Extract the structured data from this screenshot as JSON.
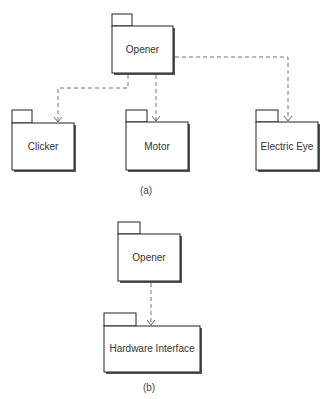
{
  "diagram_a": {
    "caption": "(a)",
    "packages": {
      "opener": {
        "label": "Opener"
      },
      "clicker": {
        "label": "Clicker"
      },
      "motor": {
        "label": "Motor"
      },
      "electric_eye": {
        "label": "Electric Eye"
      }
    },
    "dependencies": [
      {
        "from": "Opener",
        "to": "Clicker",
        "style": "dashed",
        "arrow": "open"
      },
      {
        "from": "Opener",
        "to": "Motor",
        "style": "dashed",
        "arrow": "open"
      },
      {
        "from": "Opener",
        "to": "Electric Eye",
        "style": "dashed",
        "arrow": "open"
      }
    ]
  },
  "diagram_b": {
    "caption": "(b)",
    "packages": {
      "opener": {
        "label": "Opener"
      },
      "hardware_interface": {
        "label": "Hardware Interface"
      }
    },
    "dependencies": [
      {
        "from": "Opener",
        "to": "Hardware Interface",
        "style": "dashed",
        "arrow": "open"
      }
    ]
  },
  "colors": {
    "outline": "#222222",
    "shadow": "#555555",
    "dependency_line": "#666666",
    "text": "#333333",
    "background": "#ffffff"
  }
}
